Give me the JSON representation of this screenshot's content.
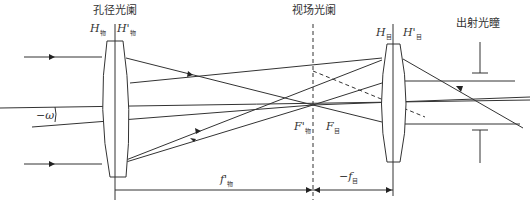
{
  "diagram": {
    "labels": {
      "aperture_stop": "孔径光阑",
      "field_stop": "视场光阑",
      "exit_pupil": "出射光瞳",
      "objective_front_principal": "H",
      "objective_front_principal_sub": "物",
      "objective_back_principal": "H'",
      "objective_back_principal_sub": "物",
      "eyepiece_front_principal": "H",
      "eyepiece_front_principal_sub": "目",
      "eyepiece_back_principal": "H'",
      "eyepiece_back_principal_sub": "目",
      "objective_focus": "F'",
      "objective_focus_sub": "物",
      "eyepiece_focus": "F",
      "eyepiece_focus_sub": "目",
      "field_angle": "−ω",
      "objective_focal_length": "f'",
      "objective_focal_length_sub": "物",
      "eyepiece_focal_length": "−f",
      "eyepiece_focal_length_sub": "目"
    },
    "colors": {
      "line": "#333333",
      "background": "#ffffff"
    }
  }
}
